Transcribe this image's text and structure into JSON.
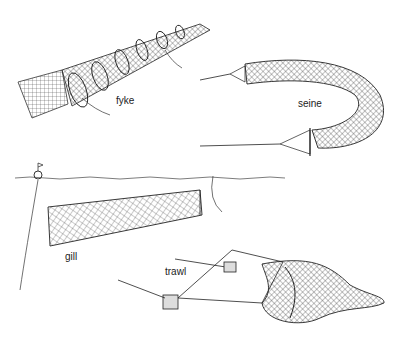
{
  "figure": {
    "background": "#ffffff",
    "ink_color": "#222222",
    "labels": {
      "fyke": "fyke",
      "seine": "seine",
      "gill": "gill",
      "trawl": "trawl"
    }
  }
}
